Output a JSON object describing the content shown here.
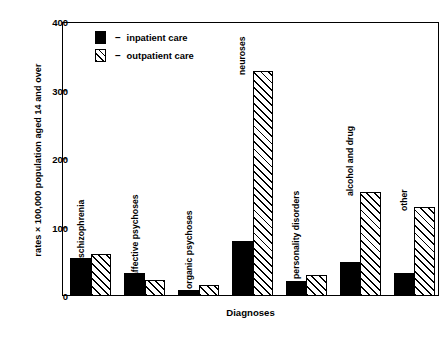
{
  "chart_data": {
    "type": "bar",
    "title": "",
    "xlabel": "Diagnoses",
    "ylabel": "rates × 100,000 population aged 14 and over",
    "ylim": [
      0,
      400
    ],
    "yticks": [
      0,
      100,
      200,
      300,
      400
    ],
    "ytick_labels": [
      "0",
      "100",
      "200",
      "300",
      "400"
    ],
    "grid": false,
    "legend_position": "top-left",
    "categories": [
      "schizophrenia",
      "affective psychoses",
      "organic psychoses",
      "neuroses",
      "personality disorders",
      "alcohol and drug",
      "other"
    ],
    "series": [
      {
        "name": "inpatient care",
        "style": "solid-black",
        "values": [
          56,
          33,
          9,
          80,
          22,
          50,
          33
        ]
      },
      {
        "name": "outpatient care",
        "style": "diagonal-hatch",
        "values": [
          62,
          24,
          16,
          328,
          30,
          152,
          130
        ]
      }
    ]
  },
  "legend": {
    "dash": "–",
    "items": [
      {
        "label": "inpatient care",
        "swatch": "solid-black-square"
      },
      {
        "label": "outpatient care",
        "swatch": "hatched-square"
      }
    ]
  }
}
